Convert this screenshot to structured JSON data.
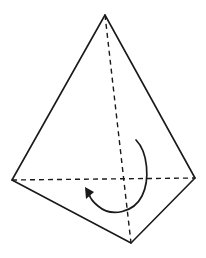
{
  "diagram": {
    "type": "tetrahedron-with-rotation-arrow",
    "colors": {
      "stroke": "#1a1a1a",
      "background": "#ffffff"
    },
    "vertices": {
      "apex": [
        105,
        15
      ],
      "left": [
        12,
        180
      ],
      "right": [
        195,
        178
      ],
      "front": [
        131,
        243
      ]
    },
    "solid_edges": [
      [
        "apex",
        "left"
      ],
      [
        "apex",
        "right"
      ],
      [
        "left",
        "front"
      ],
      [
        "right",
        "front"
      ]
    ],
    "dashed_edges": [
      [
        "apex",
        "front"
      ],
      [
        "left",
        "right"
      ]
    ],
    "rotation_arrow": {
      "direction": "counterclockwise",
      "start": [
        136,
        140
      ],
      "end": [
        86,
        190
      ]
    }
  }
}
